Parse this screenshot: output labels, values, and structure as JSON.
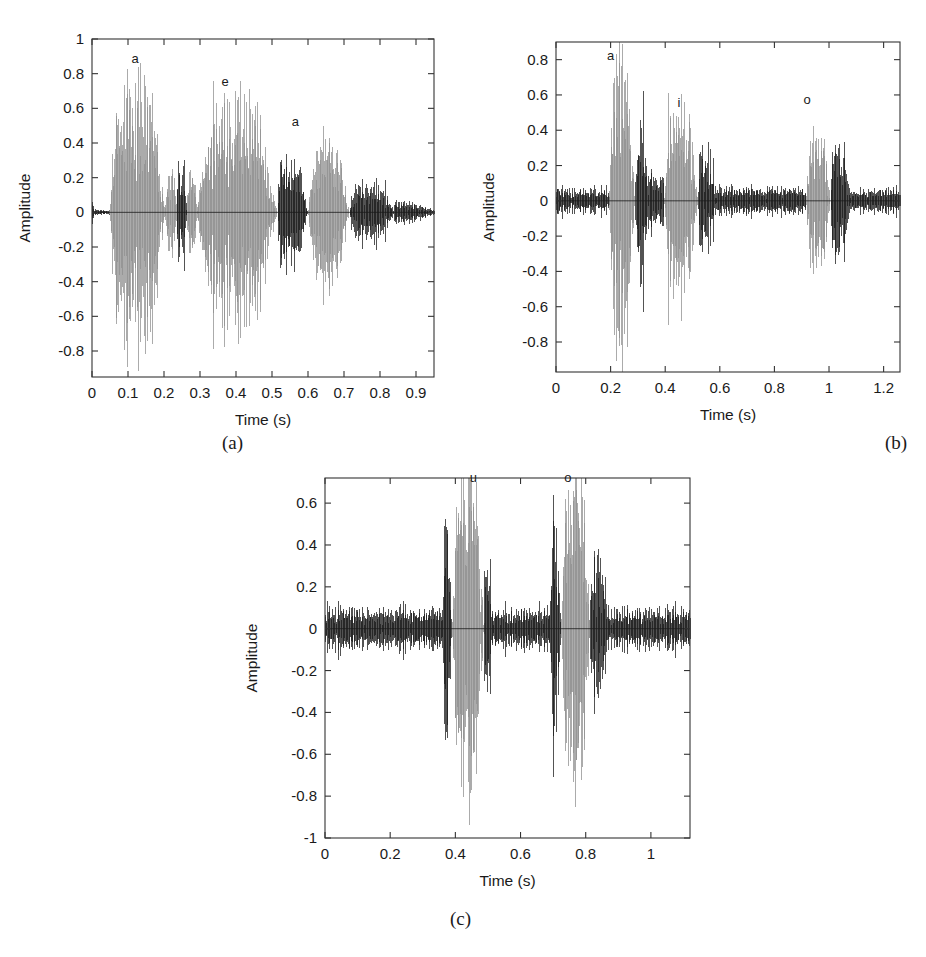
{
  "figure": {
    "background_color": "#ffffff",
    "waveform_color_primary": "#1a1a1a",
    "waveform_color_highlight": "#8f8f8f",
    "axis_color": "#333333"
  },
  "panels": [
    {
      "id": "a",
      "caption": "(a)",
      "xlabel": "Time (s)",
      "ylabel": "Amplitude",
      "xticks": [
        "0",
        "0.1",
        "0.2",
        "0.3",
        "0.4",
        "0.5",
        "0.6",
        "0.7",
        "0.8",
        "0.9"
      ],
      "xtick_values": [
        0,
        0.1,
        0.2,
        0.3,
        0.4,
        0.5,
        0.6,
        0.7,
        0.8,
        0.9
      ],
      "yticks": [
        "1",
        "0.8",
        "0.6",
        "0.4",
        "0.2",
        "0",
        "-0.2",
        "-0.4",
        "-0.6",
        "-0.8"
      ],
      "ytick_values": [
        1,
        0.8,
        0.6,
        0.4,
        0.2,
        0,
        -0.2,
        -0.4,
        -0.6,
        -0.8
      ],
      "xlim": [
        0,
        0.95
      ],
      "ylim": [
        -0.95,
        1.0
      ],
      "annotations": [
        {
          "text": "a",
          "x": 0.12,
          "y": 0.86
        },
        {
          "text": "e",
          "x": 0.37,
          "y": 0.73
        },
        {
          "text": "a",
          "x": 0.565,
          "y": 0.5
        }
      ]
    },
    {
      "id": "b",
      "caption": "(b)",
      "xlabel": "Time (s)",
      "ylabel": "Amplitude",
      "xticks": [
        "0",
        "0.2",
        "0.4",
        "0.6",
        "0.8",
        "1",
        "1.2"
      ],
      "xtick_values": [
        0,
        0.2,
        0.4,
        0.6,
        0.8,
        1.0,
        1.2
      ],
      "yticks": [
        "0.8",
        "0.6",
        "0.4",
        "0.2",
        "0",
        "-0.2",
        "-0.4",
        "-0.6",
        "-0.8"
      ],
      "ytick_values": [
        0.8,
        0.6,
        0.4,
        0.2,
        0,
        -0.2,
        -0.4,
        -0.6,
        -0.8
      ],
      "xlim": [
        0,
        1.26
      ],
      "ylim": [
        -0.97,
        0.9
      ],
      "annotations": [
        {
          "text": "a",
          "x": 0.2,
          "y": 0.8
        },
        {
          "text": "i",
          "x": 0.45,
          "y": 0.53
        },
        {
          "text": "o",
          "x": 0.92,
          "y": 0.55
        }
      ]
    },
    {
      "id": "c",
      "caption": "(c)",
      "xlabel": "Time (s)",
      "ylabel": "Amplitude",
      "xticks": [
        "0",
        "0.2",
        "0.4",
        "0.6",
        "0.8",
        "1"
      ],
      "xtick_values": [
        0,
        0.2,
        0.4,
        0.6,
        0.8,
        1.0
      ],
      "yticks": [
        "0.6",
        "0.4",
        "0.2",
        "0",
        "-0.2",
        "-0.4",
        "-0.6",
        "-0.8",
        "-1"
      ],
      "ytick_values": [
        0.6,
        0.4,
        0.2,
        0,
        -0.2,
        -0.4,
        -0.6,
        -0.8,
        -1
      ],
      "xlim": [
        0,
        1.12
      ],
      "ylim": [
        -1.0,
        0.72
      ],
      "annotations": [
        {
          "text": "u",
          "x": 0.455,
          "y": 0.7
        },
        {
          "text": "o",
          "x": 0.745,
          "y": 0.7
        }
      ]
    }
  ],
  "chart_data": [
    {
      "type": "line",
      "panel": "a",
      "title": "",
      "subtitle": "",
      "xlabel": "Time (s)",
      "ylabel": "Amplitude",
      "xlim": [
        0,
        0.95
      ],
      "ylim": [
        -0.95,
        1.0
      ],
      "grid": false,
      "legend": "none",
      "description": "Audio waveform of a spoken utterance; grey portions mark annotated vowel segments, black portions mark the remaining speech.",
      "annotations": [
        {
          "label": "a",
          "x": 0.12,
          "y": 0.86
        },
        {
          "label": "e",
          "x": 0.37,
          "y": 0.73
        },
        {
          "label": "a",
          "x": 0.565,
          "y": 0.5
        }
      ],
      "segments": [
        {
          "t_start": 0.0,
          "t_end": 0.048,
          "color": "black",
          "peak": 0.06,
          "kind": "silence"
        },
        {
          "t_start": 0.048,
          "t_end": 0.205,
          "color": "grey",
          "peak": 0.9,
          "kind": "vowel-a"
        },
        {
          "t_start": 0.205,
          "t_end": 0.235,
          "color": "grey",
          "peak": 0.28,
          "kind": "transition"
        },
        {
          "t_start": 0.235,
          "t_end": 0.265,
          "color": "black",
          "peak": 0.43,
          "kind": "consonant"
        },
        {
          "t_start": 0.265,
          "t_end": 0.29,
          "color": "grey",
          "peak": 0.3,
          "kind": "transition"
        },
        {
          "t_start": 0.29,
          "t_end": 0.515,
          "color": "grey",
          "peak": 0.76,
          "kind": "vowel-e"
        },
        {
          "t_start": 0.515,
          "t_end": 0.6,
          "color": "black",
          "peak": 0.44,
          "kind": "consonant"
        },
        {
          "t_start": 0.6,
          "t_end": 0.715,
          "color": "grey",
          "peak": 0.5,
          "kind": "vowel-a"
        },
        {
          "t_start": 0.715,
          "t_end": 0.84,
          "color": "black",
          "peak": 0.26,
          "kind": "consonant"
        },
        {
          "t_start": 0.84,
          "t_end": 0.95,
          "color": "black",
          "peak": 0.1,
          "kind": "decay"
        }
      ]
    },
    {
      "type": "line",
      "panel": "b",
      "title": "",
      "subtitle": "",
      "xlabel": "Time (s)",
      "ylabel": "Amplitude",
      "xlim": [
        0,
        1.26
      ],
      "ylim": [
        -0.97,
        0.9
      ],
      "grid": false,
      "legend": "none",
      "description": "Audio waveform with three annotated vowel bursts (a, i, o) shown in grey against background speech/noise in black.",
      "annotations": [
        {
          "label": "a",
          "x": 0.2,
          "y": 0.8
        },
        {
          "label": "i",
          "x": 0.45,
          "y": 0.53
        },
        {
          "label": "o",
          "x": 0.92,
          "y": 0.55
        }
      ],
      "segments": [
        {
          "t_start": 0.0,
          "t_end": 0.195,
          "color": "black",
          "peak": 0.09,
          "kind": "noise"
        },
        {
          "t_start": 0.195,
          "t_end": 0.29,
          "color": "grey",
          "peak": 0.95,
          "kind": "vowel-a"
        },
        {
          "t_start": 0.29,
          "t_end": 0.34,
          "color": "black",
          "peak": 0.62,
          "kind": "consonant"
        },
        {
          "t_start": 0.34,
          "t_end": 0.395,
          "color": "black",
          "peak": 0.22,
          "kind": "noise"
        },
        {
          "t_start": 0.395,
          "t_end": 0.52,
          "color": "grey",
          "peak": 0.62,
          "kind": "vowel-i"
        },
        {
          "t_start": 0.52,
          "t_end": 0.585,
          "color": "black",
          "peak": 0.42,
          "kind": "consonant"
        },
        {
          "t_start": 0.585,
          "t_end": 0.915,
          "color": "black",
          "peak": 0.11,
          "kind": "noise"
        },
        {
          "t_start": 0.915,
          "t_end": 1.005,
          "color": "grey",
          "peak": 0.47,
          "kind": "vowel-o"
        },
        {
          "t_start": 1.005,
          "t_end": 1.08,
          "color": "black",
          "peak": 0.45,
          "kind": "consonant"
        },
        {
          "t_start": 1.08,
          "t_end": 1.26,
          "color": "black",
          "peak": 0.09,
          "kind": "noise"
        }
      ]
    },
    {
      "type": "line",
      "panel": "c",
      "title": "",
      "subtitle": "",
      "xlabel": "Time (s)",
      "ylabel": "Amplitude",
      "xlim": [
        0,
        1.12
      ],
      "ylim": [
        -1.0,
        0.72
      ],
      "grid": false,
      "legend": "none",
      "description": "Audio waveform with two annotated vowel bursts (u, o) in grey and continuous background noise in black.",
      "annotations": [
        {
          "label": "u",
          "x": 0.455,
          "y": 0.7
        },
        {
          "label": "o",
          "x": 0.745,
          "y": 0.7
        }
      ],
      "segments": [
        {
          "t_start": 0.0,
          "t_end": 0.36,
          "color": "black",
          "peak": 0.13,
          "kind": "noise"
        },
        {
          "t_start": 0.36,
          "t_end": 0.39,
          "color": "black",
          "peak": 0.58,
          "kind": "onset"
        },
        {
          "t_start": 0.39,
          "t_end": 0.49,
          "color": "grey",
          "peak": 0.87,
          "kind": "vowel-u"
        },
        {
          "t_start": 0.49,
          "t_end": 0.52,
          "color": "black",
          "peak": 0.5,
          "kind": "offset"
        },
        {
          "t_start": 0.52,
          "t_end": 0.69,
          "color": "black",
          "peak": 0.13,
          "kind": "noise"
        },
        {
          "t_start": 0.69,
          "t_end": 0.725,
          "color": "black",
          "peak": 0.64,
          "kind": "onset"
        },
        {
          "t_start": 0.725,
          "t_end": 0.815,
          "color": "grey",
          "peak": 0.88,
          "kind": "vowel-o"
        },
        {
          "t_start": 0.815,
          "t_end": 0.88,
          "color": "black",
          "peak": 0.52,
          "kind": "offset"
        },
        {
          "t_start": 0.88,
          "t_end": 1.12,
          "color": "black",
          "peak": 0.13,
          "kind": "noise"
        }
      ]
    }
  ]
}
